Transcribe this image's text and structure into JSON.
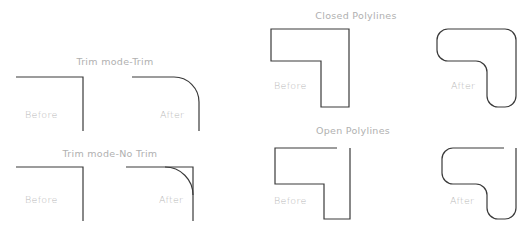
{
  "diagram": {
    "panels": {
      "trim": {
        "title": "Trim mode-Trim",
        "before_label": "Before",
        "after_label": "After"
      },
      "no_trim": {
        "title": "Trim mode-No Trim",
        "before_label": "Before",
        "after_label": "After"
      },
      "closed": {
        "title": "Closed Polylines",
        "before_label": "Before",
        "after_label": "After"
      },
      "open": {
        "title": "Open Polylines",
        "before_label": "Before",
        "after_label": "After"
      }
    },
    "colors": {
      "stroke": "#3a3a3a",
      "text": "#b8b8b8",
      "background": "#ffffff"
    }
  }
}
